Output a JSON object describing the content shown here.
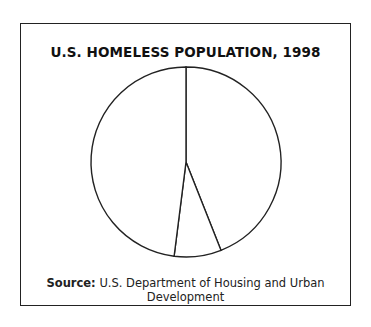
{
  "chart_data": {
    "type": "pie",
    "title": "U.S. HOMELESS POPULATION, 1998",
    "categories": [
      "Slice 1",
      "Slice 2",
      "Slice 3"
    ],
    "values": [
      44,
      8,
      48
    ],
    "labels_shown": false,
    "legend": "none",
    "source_label": "Source:",
    "source_text": "U.S. Department of Housing and Urban Development"
  },
  "colors": {
    "stroke": "#222222",
    "fill": "#ffffff"
  }
}
